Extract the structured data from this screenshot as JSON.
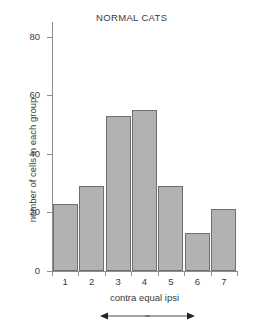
{
  "chart_data": {
    "type": "bar",
    "title": "NORMAL CATS",
    "xlabel": "contra equal ipsi",
    "ylabel": "number of cells in each group",
    "categories": [
      "1",
      "2",
      "3",
      "4",
      "5",
      "6",
      "7"
    ],
    "values": [
      23,
      29,
      53,
      55,
      29,
      13,
      21
    ],
    "ylim": [
      0,
      85
    ],
    "yticks": [
      0,
      20,
      40,
      60,
      80
    ],
    "ytick_labels": [
      "0",
      "20",
      "40",
      "60",
      "80"
    ],
    "grid": false,
    "legend": "none",
    "annotations": [
      {
        "name": "contra-arrow",
        "direction": "left",
        "label": ""
      },
      {
        "name": "ipsi-arrow",
        "direction": "right",
        "label": ""
      }
    ],
    "bar_fill_color": "#b2b2b2",
    "bar_edge_color": "#6f6f6f",
    "axis_color": "#8d8d8d",
    "background_color": "#ffffff"
  }
}
